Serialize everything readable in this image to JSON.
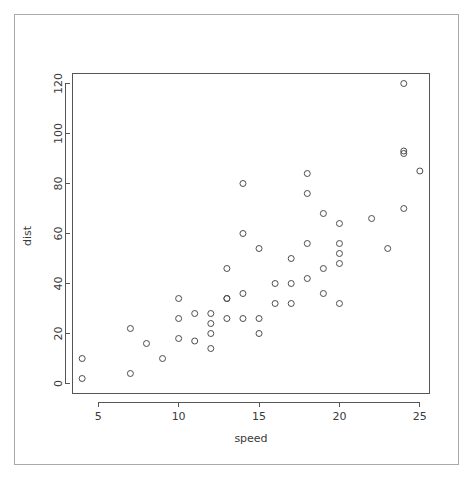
{
  "chart_data": {
    "type": "scatter",
    "title": "",
    "subtitle": "",
    "xlabel": "speed",
    "ylabel": "dist",
    "xlim": [
      3.4,
      25.6
    ],
    "ylim": [
      -4.0,
      124.0
    ],
    "xticks": [
      5,
      10,
      15,
      20,
      25
    ],
    "yticks": [
      0,
      20,
      40,
      60,
      80,
      100,
      120
    ],
    "xtick_labels": [
      "5",
      "10",
      "15",
      "20",
      "25"
    ],
    "ytick_labels": [
      "0",
      "20",
      "40",
      "60",
      "80",
      "100",
      "120"
    ],
    "grid": false,
    "legend": null,
    "legend_position": "none",
    "marker": "open-circle",
    "marker_color": "#4d4d4d",
    "marker_radius": 3,
    "n_points": 50,
    "x": [
      4,
      4,
      7,
      7,
      8,
      9,
      10,
      10,
      10,
      11,
      11,
      12,
      12,
      12,
      12,
      13,
      13,
      13,
      13,
      14,
      14,
      14,
      14,
      15,
      15,
      15,
      16,
      16,
      17,
      17,
      17,
      18,
      18,
      18,
      18,
      19,
      19,
      19,
      20,
      20,
      20,
      20,
      20,
      22,
      23,
      24,
      24,
      24,
      24,
      25
    ],
    "y": [
      2,
      10,
      4,
      22,
      16,
      10,
      18,
      26,
      34,
      17,
      28,
      14,
      20,
      24,
      28,
      26,
      34,
      34,
      46,
      26,
      36,
      60,
      80,
      20,
      26,
      54,
      32,
      40,
      32,
      40,
      50,
      42,
      56,
      76,
      84,
      36,
      46,
      68,
      32,
      48,
      52,
      56,
      64,
      66,
      54,
      70,
      92,
      93,
      120,
      85
    ],
    "points": [
      {
        "speed": 4,
        "dist": 2
      },
      {
        "speed": 4,
        "dist": 10
      },
      {
        "speed": 7,
        "dist": 4
      },
      {
        "speed": 7,
        "dist": 22
      },
      {
        "speed": 8,
        "dist": 16
      },
      {
        "speed": 9,
        "dist": 10
      },
      {
        "speed": 10,
        "dist": 18
      },
      {
        "speed": 10,
        "dist": 26
      },
      {
        "speed": 10,
        "dist": 34
      },
      {
        "speed": 11,
        "dist": 17
      },
      {
        "speed": 11,
        "dist": 28
      },
      {
        "speed": 12,
        "dist": 14
      },
      {
        "speed": 12,
        "dist": 20
      },
      {
        "speed": 12,
        "dist": 24
      },
      {
        "speed": 12,
        "dist": 28
      },
      {
        "speed": 13,
        "dist": 26
      },
      {
        "speed": 13,
        "dist": 34
      },
      {
        "speed": 13,
        "dist": 34
      },
      {
        "speed": 13,
        "dist": 46
      },
      {
        "speed": 14,
        "dist": 26
      },
      {
        "speed": 14,
        "dist": 36
      },
      {
        "speed": 14,
        "dist": 60
      },
      {
        "speed": 14,
        "dist": 80
      },
      {
        "speed": 15,
        "dist": 20
      },
      {
        "speed": 15,
        "dist": 26
      },
      {
        "speed": 15,
        "dist": 54
      },
      {
        "speed": 16,
        "dist": 32
      },
      {
        "speed": 16,
        "dist": 40
      },
      {
        "speed": 17,
        "dist": 32
      },
      {
        "speed": 17,
        "dist": 40
      },
      {
        "speed": 17,
        "dist": 50
      },
      {
        "speed": 18,
        "dist": 42
      },
      {
        "speed": 18,
        "dist": 56
      },
      {
        "speed": 18,
        "dist": 76
      },
      {
        "speed": 18,
        "dist": 84
      },
      {
        "speed": 19,
        "dist": 36
      },
      {
        "speed": 19,
        "dist": 46
      },
      {
        "speed": 19,
        "dist": 68
      },
      {
        "speed": 20,
        "dist": 32
      },
      {
        "speed": 20,
        "dist": 48
      },
      {
        "speed": 20,
        "dist": 52
      },
      {
        "speed": 20,
        "dist": 56
      },
      {
        "speed": 20,
        "dist": 64
      },
      {
        "speed": 22,
        "dist": 66
      },
      {
        "speed": 23,
        "dist": 54
      },
      {
        "speed": 24,
        "dist": 70
      },
      {
        "speed": 24,
        "dist": 92
      },
      {
        "speed": 24,
        "dist": 93
      },
      {
        "speed": 24,
        "dist": 120
      },
      {
        "speed": 25,
        "dist": 85
      }
    ]
  },
  "figure": {
    "background_color": "#ffffff",
    "frame_color": "#a9a9a9",
    "axis_color": "#555555",
    "text_color": "#3a3a3a"
  }
}
